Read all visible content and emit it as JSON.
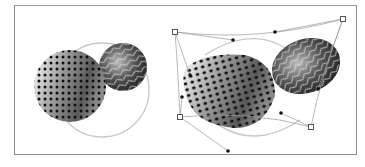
{
  "figure": {
    "panels": [
      {
        "id": "original",
        "description": "perforated-sphere-with-marbled-sphere"
      },
      {
        "id": "envelope-distorted",
        "description": "distorted-objects-with-envelope-mesh"
      }
    ],
    "colors": {
      "frame": "#8c8c8c",
      "mesh_line": "#9a9a9a",
      "ring": "#c8c8c8",
      "anchor_point": "#555555",
      "handle_point": "#111111"
    }
  }
}
